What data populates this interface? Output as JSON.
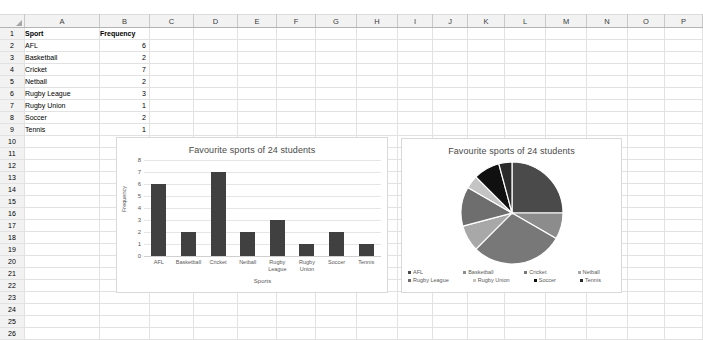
{
  "spreadsheet": {
    "column_headers": [
      "A",
      "B",
      "C",
      "D",
      "E",
      "F",
      "G",
      "H",
      "I",
      "J",
      "K",
      "L",
      "M",
      "N",
      "O",
      "P"
    ],
    "row_numbers": [
      1,
      2,
      3,
      4,
      5,
      6,
      7,
      8,
      9,
      10,
      11,
      12,
      13,
      14,
      15,
      16,
      17,
      18,
      19,
      20,
      21,
      22,
      23,
      24,
      25,
      26
    ],
    "cells": {
      "A1": "Sport",
      "B1": "Frequency",
      "A2": "AFL",
      "B2": "6",
      "A3": "Basketball",
      "B3": "2",
      "A4": "Cricket",
      "B4": "7",
      "A5": "Netball",
      "B5": "2",
      "A6": "Rugby League",
      "B6": "3",
      "A7": "Rugby Union",
      "B7": "1",
      "A8": "Soccer",
      "B8": "2",
      "A9": "Tennis",
      "B9": "1"
    }
  },
  "chart_data": [
    {
      "type": "bar",
      "title": "Favourite sports of 24 students",
      "categories": [
        "AFL",
        "Basketball",
        "Cricket",
        "Netball",
        "Rugby League",
        "Rugby Union",
        "Soccer",
        "Tennis"
      ],
      "category_lines": [
        [
          "AFL"
        ],
        [
          "Basketball"
        ],
        [
          "Cricket"
        ],
        [
          "Netball"
        ],
        [
          "Rugby",
          "League"
        ],
        [
          "Rugby",
          "Union"
        ],
        [
          "Soccer"
        ],
        [
          "Tennis"
        ]
      ],
      "values": [
        6,
        2,
        7,
        2,
        3,
        1,
        2,
        1
      ],
      "xlabel": "Sports",
      "ylabel": "Frequency",
      "ylim": [
        0,
        8
      ],
      "yticks": [
        0,
        1,
        2,
        3,
        4,
        5,
        6,
        7,
        8
      ],
      "grid": true,
      "legend": false,
      "bar_color": "#404040"
    },
    {
      "type": "pie",
      "title": "Favourite sports of 24 students",
      "labels": [
        "AFL",
        "Basketball",
        "Cricket",
        "Netball",
        "Rugby League",
        "Rugby Union",
        "Soccer",
        "Tennis"
      ],
      "values": [
        6,
        2,
        7,
        2,
        3,
        1,
        2,
        1
      ],
      "total": 24,
      "legend_position": "bottom",
      "legend_rows": [
        [
          "AFL",
          "Basketball",
          "Cricket",
          "Netball"
        ],
        [
          "Rugby League",
          "Rugby Union",
          "Soccer",
          "Tennis"
        ]
      ],
      "slice_colors": [
        "#4a4a4a",
        "#8c8c8c",
        "#787878",
        "#a8a8a8",
        "#6e6e6e",
        "#c4c4c4",
        "#101010",
        "#2b2b2b"
      ]
    }
  ]
}
